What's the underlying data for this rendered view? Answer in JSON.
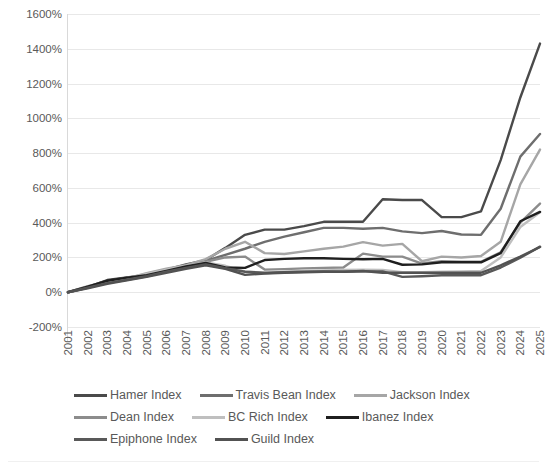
{
  "chart_data": {
    "type": "line",
    "title": "",
    "subtitle": "",
    "xlabel": "",
    "ylabel": "",
    "grid": true,
    "legend_position": "bottom",
    "x": [
      2001,
      2002,
      2003,
      2004,
      2005,
      2006,
      2007,
      2008,
      2009,
      2010,
      2011,
      2012,
      2013,
      2014,
      2015,
      2016,
      2017,
      2018,
      2019,
      2020,
      2021,
      2022,
      2023,
      2024,
      2025
    ],
    "xtick_labels": [
      "2001",
      "2002",
      "2003",
      "2004",
      "2005",
      "2006",
      "2007",
      "2008",
      "2009",
      "2010",
      "2011",
      "2012",
      "2013",
      "2014",
      "2015",
      "2016",
      "2017",
      "2018",
      "2019",
      "2020",
      "2021",
      "2022",
      "2023",
      "2024",
      "2025"
    ],
    "ytick_labels": [
      "1600%",
      "1400%",
      "1200%",
      "1000%",
      "800%",
      "600%",
      "400%",
      "200%",
      "0%",
      "-200%"
    ],
    "ytick_values": [
      1600,
      1400,
      1200,
      1000,
      800,
      600,
      400,
      200,
      0,
      -200
    ],
    "ylim": [
      -200,
      1600
    ],
    "yunit": "%",
    "series": [
      {
        "name": "Hamer Index",
        "color": "#4a4a4a",
        "values": [
          0,
          30,
          70,
          85,
          100,
          130,
          160,
          185,
          255,
          330,
          360,
          360,
          380,
          405,
          405,
          405,
          535,
          530,
          530,
          432,
          432,
          465,
          760,
          1120,
          1430
        ]
      },
      {
        "name": "Travis Bean Index",
        "color": "#6e6e6e",
        "values": [
          0,
          25,
          55,
          75,
          95,
          125,
          150,
          180,
          215,
          250,
          290,
          320,
          345,
          370,
          370,
          365,
          370,
          350,
          340,
          352,
          332,
          330,
          480,
          780,
          910
        ]
      },
      {
        "name": "Jackson Index",
        "color": "#a6a6a6",
        "values": [
          0,
          35,
          60,
          80,
          110,
          135,
          155,
          190,
          250,
          290,
          225,
          220,
          235,
          250,
          262,
          288,
          268,
          278,
          178,
          205,
          200,
          208,
          290,
          620,
          820
        ]
      },
      {
        "name": "Dean Index",
        "color": "#8c8c8c",
        "values": [
          0,
          28,
          58,
          78,
          100,
          128,
          150,
          175,
          200,
          205,
          130,
          133,
          137,
          140,
          142,
          222,
          205,
          205,
          165,
          178,
          175,
          175,
          230,
          400,
          510
        ]
      },
      {
        "name": "BC Rich Index",
        "color": "#bfbfbf",
        "values": [
          0,
          30,
          62,
          82,
          105,
          130,
          152,
          172,
          152,
          120,
          108,
          118,
          122,
          125,
          128,
          130,
          128,
          115,
          115,
          118,
          120,
          122,
          200,
          375,
          460
        ]
      },
      {
        "name": "Ibanez Index",
        "color": "#1f1f1f",
        "values": [
          0,
          32,
          66,
          84,
          98,
          122,
          148,
          168,
          142,
          140,
          185,
          192,
          195,
          195,
          192,
          190,
          192,
          158,
          160,
          172,
          172,
          172,
          225,
          408,
          462
        ]
      },
      {
        "name": "Epiphone Index",
        "color": "#595959",
        "values": [
          0,
          26,
          52,
          72,
          92,
          118,
          140,
          160,
          138,
          118,
          112,
          115,
          118,
          120,
          118,
          120,
          120,
          88,
          92,
          98,
          98,
          98,
          142,
          198,
          262
        ]
      },
      {
        "name": "Guild Index",
        "color": "#525252",
        "values": [
          0,
          22,
          48,
          68,
          88,
          112,
          135,
          155,
          135,
          100,
          108,
          112,
          115,
          118,
          118,
          122,
          112,
          112,
          112,
          112,
          112,
          112,
          155,
          205,
          260
        ]
      }
    ]
  },
  "legend": {
    "rows": [
      [
        "Hamer Index",
        "Travis Bean Index",
        "Jackson Index"
      ],
      [
        "Dean Index",
        "BC Rich Index",
        "Ibanez Index"
      ],
      [
        "Epiphone Index",
        "Guild Index"
      ]
    ]
  }
}
